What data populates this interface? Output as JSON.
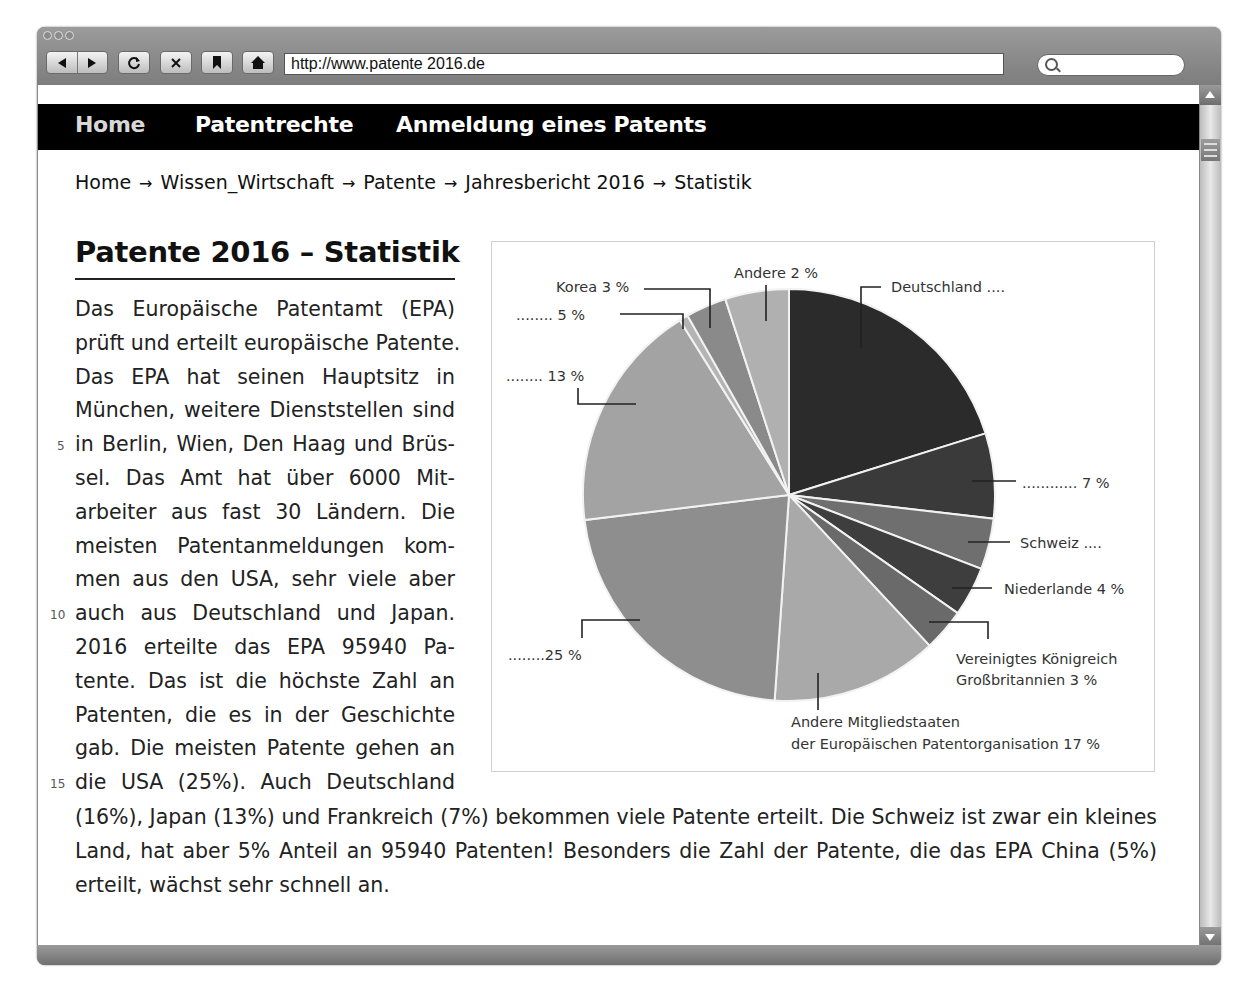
{
  "browser": {
    "url": "http://www.patente 2016.de",
    "buttons": [
      "back",
      "forward",
      "reload",
      "stop",
      "bookmark",
      "home"
    ]
  },
  "nav": {
    "items": [
      {
        "label": "Home"
      },
      {
        "label": "Patentrechte"
      },
      {
        "label": "Anmeldung eines Patents"
      }
    ]
  },
  "breadcrumb": {
    "items": [
      "Home",
      "Wissen_Wirtschaft",
      "Patente",
      "Jahresbericht 2016",
      "Statistik"
    ],
    "separator": "→"
  },
  "article": {
    "title": "Patente 2016 – Statistik",
    "column_lines": [
      "Das Europäische Patentamt (EPA)",
      "prüft und erteilt europäische Patente.",
      "Das EPA hat seinen Hauptsitz in",
      "München, weitere Dienststellen sind",
      "in Berlin, Wien, Den Haag und Brüs-",
      "sel. Das Amt hat über 6000 Mit-",
      "arbeiter aus fast 30 Ländern. Die",
      "meisten Patentanmeldungen kom-",
      "men aus den USA, sehr viele aber",
      "auch aus Deutschland und Japan.",
      "2016 erteilte das EPA 95940 Pa-",
      "tente. Das ist die höchste Zahl an",
      "Patenten, die es in der Geschichte",
      "gab. Die meisten Patente gehen an",
      "die USA (25%). Auch Deutschland"
    ],
    "full_lines": [
      "(16%), Japan (13%) und Frankreich (7%) bekommen viele Patente erteilt. Die Schweiz ist zwar ein kleines",
      "Land, hat aber 5% Anteil an 95940 Patenten! Besonders die Zahl der Patente, die das EPA China (5%)",
      "erteilt, wächst sehr schnell an."
    ],
    "line_numbers": {
      "5": "5",
      "10": "10",
      "15": "15"
    }
  },
  "chart_data": {
    "type": "pie",
    "title": "",
    "slices": [
      {
        "label": "Deutschland",
        "display": "Deutschland ....",
        "value": 16,
        "start_deg": 0,
        "end_deg": 72.6,
        "color": "#2b2b2b"
      },
      {
        "label": "Frankreich",
        "display": "............7 %",
        "value": 7,
        "start_deg": 72.6,
        "end_deg": 96.6,
        "color": "#3a3a3a"
      },
      {
        "label": "Schweiz",
        "display": "Schweiz ....",
        "value": 5,
        "start_deg": 96.6,
        "end_deg": 111,
        "color": "#6f6f6f"
      },
      {
        "label": "Niederlande",
        "display": "Niederlande 4 %",
        "value": 4,
        "start_deg": 111,
        "end_deg": 125,
        "color": "#3e3e3e"
      },
      {
        "label": "Vereinigtes Königreich Großbritannien",
        "display": "Vereinigtes Königreich Großbritannien 3 %",
        "value": 3,
        "start_deg": 125,
        "end_deg": 137,
        "color": "#6a6a6a"
      },
      {
        "label": "Andere Mitgliedstaaten der Europäischen Patentorganisation",
        "display": "Andere Mitgliedstaaten der Europäischen Patentorganisation 17 %",
        "value": 17,
        "start_deg": 137,
        "end_deg": 184,
        "color": "#a9a9a9"
      },
      {
        "label": "USA",
        "display": "........25 %",
        "value": 25,
        "start_deg": 184,
        "end_deg": 263,
        "color": "#8e8e8e"
      },
      {
        "label": "Japan",
        "display": "........13 %",
        "value": 13,
        "start_deg": 263,
        "end_deg": 328,
        "color": "#a3a3a3"
      },
      {
        "label": "China",
        "display": "........5 %",
        "value": 5,
        "start_deg": 328,
        "end_deg": 330.5,
        "color": "#b4b4b4"
      },
      {
        "label": "Korea",
        "display": "Korea 3 %",
        "value": 3,
        "start_deg": 330.5,
        "end_deg": 342,
        "color": "#8a8a8a"
      },
      {
        "label": "Andere",
        "display": "Andere 2 %",
        "value": 2,
        "start_deg": 342,
        "end_deg": 360,
        "color": "#b0b0b0"
      }
    ],
    "note": "Some labels are intentionally blank (dotted leaders) as in the source: Deutschland, Frankreich(7%), Schweiz, USA(25%), Japan(13%), China(5%).",
    "legend": "none (leader-line labels)"
  }
}
